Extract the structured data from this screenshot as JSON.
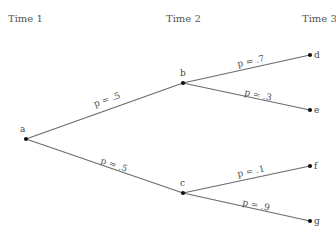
{
  "diagram": {
    "type": "probability-tree",
    "times": [
      {
        "label": "Time 1",
        "x": 8,
        "y": 22
      },
      {
        "label": "Time 2",
        "x": 166,
        "y": 22
      },
      {
        "label": "Time 3",
        "x": 302,
        "y": 22
      }
    ],
    "nodes": {
      "a": {
        "label": "a",
        "x": 26,
        "y": 139
      },
      "b": {
        "label": "b",
        "x": 183,
        "y": 83
      },
      "c": {
        "label": "c",
        "x": 183,
        "y": 193
      },
      "d": {
        "label": "d",
        "x": 310,
        "y": 55
      },
      "e": {
        "label": "e",
        "x": 310,
        "y": 110
      },
      "f": {
        "label": "f",
        "x": 310,
        "y": 166
      },
      "g": {
        "label": "g",
        "x": 310,
        "y": 221
      }
    },
    "edges": [
      {
        "from": "a",
        "to": "b",
        "label": "p = .5"
      },
      {
        "from": "a",
        "to": "c",
        "label": "p = .5"
      },
      {
        "from": "b",
        "to": "d",
        "label": "p = .7"
      },
      {
        "from": "b",
        "to": "e",
        "label": "p = .3"
      },
      {
        "from": "c",
        "to": "f",
        "label": "p = .1"
      },
      {
        "from": "c",
        "to": "g",
        "label": "p = .9"
      }
    ]
  }
}
